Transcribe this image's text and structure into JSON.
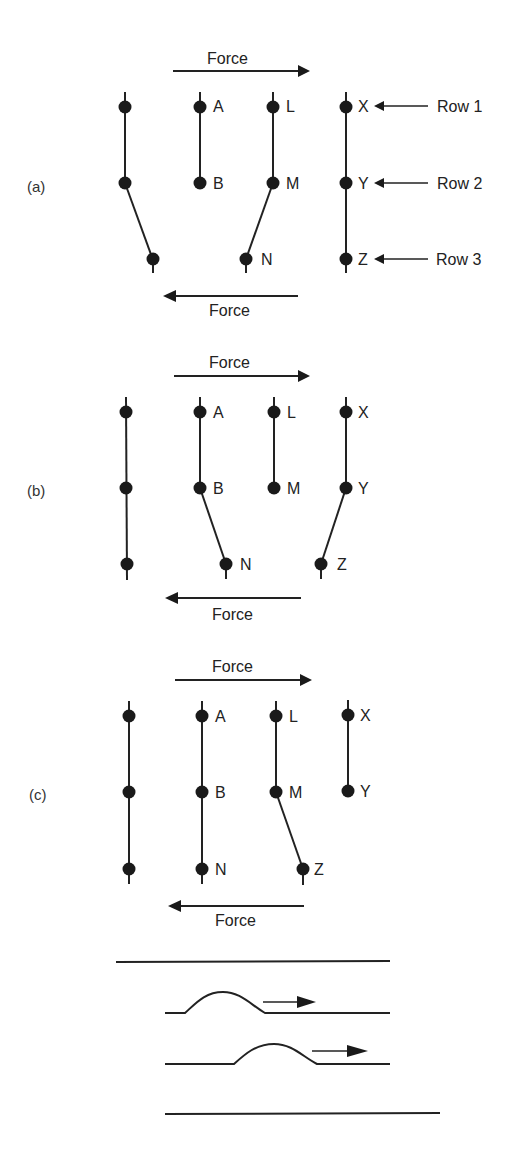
{
  "figure": {
    "force_label": "Force",
    "row_labels": [
      "Row 1",
      "Row 2",
      "Row 3"
    ],
    "panels": [
      {
        "id": "a",
        "label": "(a)",
        "atoms": {
          "A": "A",
          "B": "B",
          "L": "L",
          "M": "M",
          "N": "N",
          "X": "X",
          "Y": "Y",
          "Z": "Z"
        }
      },
      {
        "id": "b",
        "label": "(b)",
        "atoms": {
          "A": "A",
          "B": "B",
          "L": "L",
          "M": "M",
          "N": "N",
          "X": "X",
          "Y": "Y",
          "Z": "Z"
        }
      },
      {
        "id": "c",
        "label": "(c)",
        "atoms": {
          "A": "A",
          "B": "B",
          "L": "L",
          "M": "M",
          "N": "N",
          "X": "X",
          "Y": "Y",
          "Z": "Z"
        }
      }
    ],
    "caterpillar_analogy": {
      "description": "Rug/caterpillar analogy: a hump travelling along a layer in the direction of the arrow"
    }
  }
}
